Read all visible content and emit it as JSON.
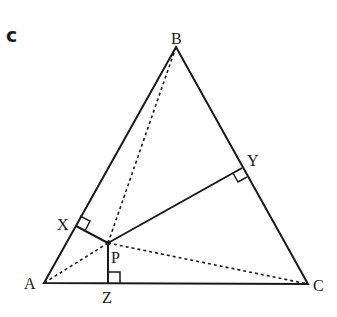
{
  "part_label": "c",
  "points": {
    "A": {
      "label": "A",
      "x": 44,
      "y": 283
    },
    "B": {
      "label": "B",
      "x": 176,
      "y": 47
    },
    "C": {
      "label": "C",
      "x": 308,
      "y": 284
    },
    "P": {
      "label": "P",
      "x": 108,
      "y": 243
    },
    "X": {
      "label": "X",
      "x": 76,
      "y": 226
    },
    "Y": {
      "label": "Y",
      "x": 242,
      "y": 168
    },
    "Z": {
      "label": "Z",
      "x": 108,
      "y": 283
    }
  },
  "segments": {
    "solid": [
      "AB",
      "BC",
      "CA",
      "PX",
      "PY",
      "PZ"
    ],
    "dashed": [
      "PA",
      "PB",
      "PC"
    ]
  },
  "right_angles": [
    "X",
    "Y",
    "Z"
  ],
  "colors": {
    "stroke": "#1a1a1a",
    "background": "#ffffff"
  }
}
